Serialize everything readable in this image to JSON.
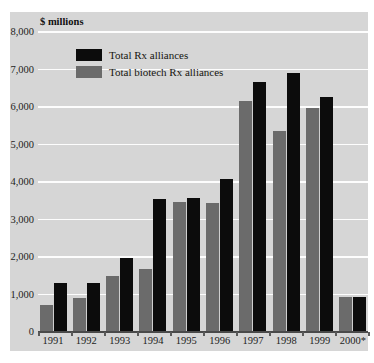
{
  "chart_data": {
    "type": "bar",
    "title": "",
    "axis_unit_label": "$ millions",
    "xlabel": "",
    "ylabel": "$ millions",
    "ylim": [
      0,
      8000
    ],
    "ytick_step": 1000,
    "yticks": [
      "8,000",
      "7,000",
      "6,000",
      "5,000",
      "4,000",
      "3,000",
      "2,000",
      "1,000",
      "0"
    ],
    "ytick_values": [
      8000,
      7000,
      6000,
      5000,
      4000,
      3000,
      2000,
      1000,
      0
    ],
    "grid": true,
    "grid_color": "#fdfdfd",
    "legend_position": "upper-left-inside",
    "categories": [
      "1991",
      "1992",
      "1993",
      "1994",
      "1995",
      "1996",
      "1997",
      "1998",
      "1999",
      "2000*"
    ],
    "series": [
      {
        "name": "Total biotech Rx alliances",
        "color": "#6b6b6b",
        "values": [
          700,
          880,
          1470,
          1660,
          3450,
          3410,
          6140,
          5340,
          5940,
          900
        ]
      },
      {
        "name": "Total Rx alliances",
        "color": "#0c0c0c",
        "values": [
          1280,
          1270,
          1960,
          3520,
          3560,
          4050,
          6640,
          6890,
          6230,
          910
        ]
      }
    ],
    "series_draw_order": [
      "Total biotech Rx alliances",
      "Total Rx alliances"
    ],
    "footnote_marker": "*",
    "background_color": "#d6d6d6"
  },
  "legend": {
    "items": [
      {
        "label": "Total Rx alliances",
        "swatch": "black"
      },
      {
        "label": "Total biotech Rx alliances",
        "swatch": "gray"
      }
    ]
  }
}
